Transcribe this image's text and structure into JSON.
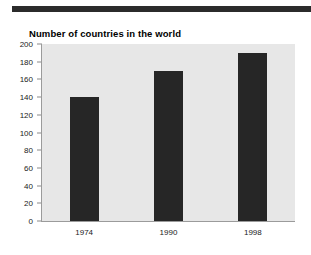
{
  "document": {
    "rule_color": "#2b2b2b"
  },
  "chart_data": {
    "type": "bar",
    "title": "Number of countries in the world",
    "xlabel": "",
    "ylabel": "",
    "categories": [
      "1974",
      "1990",
      "1998"
    ],
    "values": [
      140,
      170,
      190
    ],
    "ylim": [
      0,
      200
    ],
    "ytick_step": 20,
    "yticks": [
      0,
      20,
      40,
      60,
      80,
      100,
      120,
      140,
      160,
      180,
      200
    ],
    "ytick_labels": [
      "0",
      "20",
      "40",
      "60",
      "80",
      "100",
      "120",
      "140",
      "160",
      "180",
      "200"
    ],
    "grid": false,
    "legend": null,
    "bar_color": "#262626",
    "plot_background": "#e7e7e7"
  }
}
